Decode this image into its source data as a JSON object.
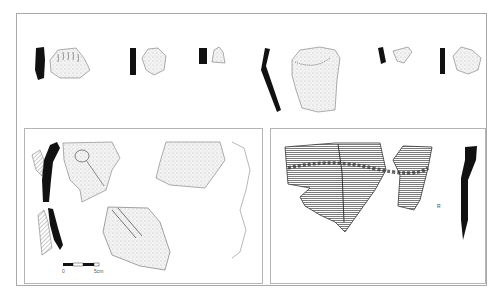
{
  "plate": {
    "type": "archaeological pottery sherd illustration plate",
    "background": "#ffffff",
    "ink": "#111111",
    "frame_color": "#a8a8a8"
  },
  "top_row": {
    "sherds": [
      {
        "id": 1,
        "profile": "solid-black section",
        "decoration": "finger-nail impressed ridges"
      },
      {
        "id": 2,
        "profile": "solid-black section",
        "decoration": "rounded stippled sherd"
      },
      {
        "id": 3,
        "profile": "solid-black section",
        "decoration": "small triangular stippled sherd"
      },
      {
        "id": 4,
        "profile": "angled solid-black section",
        "decoration": "rim with dotted band"
      },
      {
        "id": 5,
        "profile": "short solid-black section",
        "decoration": "small triangular sherd"
      },
      {
        "id": 6,
        "profile": "solid-black section",
        "decoration": "stippled rim sherd"
      }
    ]
  },
  "bottom_left_panel": {
    "sherds": [
      {
        "id": 7,
        "profile": "black and hatched section",
        "decoration": "applied knob/lug"
      },
      {
        "id": 8,
        "profile": "outline",
        "decoration": "stippled body sherd"
      },
      {
        "id": 9,
        "profile": "black and hatched section",
        "decoration": "diagonal applied ridge"
      }
    ],
    "scale_bar": {
      "start_label": "0",
      "end_label": "5cm"
    }
  },
  "bottom_right_panel": {
    "sherds": [
      {
        "id": 10,
        "profile": "curved solid-black rim section",
        "decoration": "horizontal hatching with impressed cordon"
      }
    ],
    "mark": "R"
  }
}
